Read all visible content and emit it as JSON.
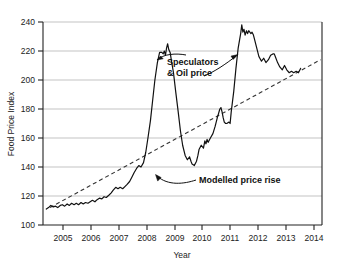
{
  "chart_data": {
    "type": "line",
    "title": "",
    "xlabel": "Year",
    "ylabel": "Food Price Index",
    "xlim": [
      2004.3,
      2014.35
    ],
    "ylim": [
      100,
      240
    ],
    "grid": true,
    "legend": "none",
    "yticks": [
      100,
      120,
      140,
      160,
      180,
      200,
      220,
      240
    ],
    "xticks": [
      2005,
      2006,
      2007,
      2008,
      2009,
      2010,
      2011,
      2012,
      2013,
      2014
    ],
    "series": [
      {
        "name": "Food Price Index",
        "style": "solid",
        "color": "#1a1a1a",
        "points": [
          [
            2004.42,
            111
          ],
          [
            2004.5,
            112
          ],
          [
            2004.58,
            113.5
          ],
          [
            2004.67,
            112.5
          ],
          [
            2004.75,
            113
          ],
          [
            2004.83,
            112
          ],
          [
            2004.92,
            113.5
          ],
          [
            2005.0,
            114
          ],
          [
            2005.08,
            113
          ],
          [
            2005.17,
            114.5
          ],
          [
            2005.25,
            113.5
          ],
          [
            2005.33,
            115
          ],
          [
            2005.42,
            114
          ],
          [
            2005.5,
            115
          ],
          [
            2005.58,
            114
          ],
          [
            2005.67,
            115.5
          ],
          [
            2005.75,
            114.5
          ],
          [
            2005.83,
            115.5
          ],
          [
            2005.92,
            115
          ],
          [
            2006.0,
            116
          ],
          [
            2006.08,
            117
          ],
          [
            2006.17,
            116
          ],
          [
            2006.25,
            117.5
          ],
          [
            2006.33,
            118.5
          ],
          [
            2006.42,
            118
          ],
          [
            2006.5,
            119.5
          ],
          [
            2006.58,
            119
          ],
          [
            2006.67,
            120.5
          ],
          [
            2006.75,
            122
          ],
          [
            2006.83,
            124
          ],
          [
            2006.92,
            126
          ],
          [
            2007.0,
            125
          ],
          [
            2007.08,
            126
          ],
          [
            2007.17,
            125
          ],
          [
            2007.25,
            126.5
          ],
          [
            2007.33,
            128
          ],
          [
            2007.42,
            130
          ],
          [
            2007.5,
            133
          ],
          [
            2007.58,
            136
          ],
          [
            2007.67,
            139
          ],
          [
            2007.75,
            141
          ],
          [
            2007.83,
            140
          ],
          [
            2007.92,
            143
          ],
          [
            2008.0,
            150
          ],
          [
            2008.08,
            160
          ],
          [
            2008.17,
            172
          ],
          [
            2008.25,
            186
          ],
          [
            2008.33,
            200
          ],
          [
            2008.42,
            212
          ],
          [
            2008.5,
            219
          ],
          [
            2008.58,
            219
          ],
          [
            2008.63,
            218
          ],
          [
            2008.67,
            220
          ],
          [
            2008.71,
            217
          ],
          [
            2008.75,
            222
          ],
          [
            2008.79,
            225
          ],
          [
            2008.83,
            221
          ],
          [
            2008.88,
            219
          ],
          [
            2008.92,
            214
          ],
          [
            2009.0,
            205
          ],
          [
            2009.08,
            192
          ],
          [
            2009.17,
            178
          ],
          [
            2009.25,
            165
          ],
          [
            2009.33,
            155
          ],
          [
            2009.42,
            148
          ],
          [
            2009.5,
            145
          ],
          [
            2009.58,
            147
          ],
          [
            2009.63,
            144
          ],
          [
            2009.67,
            142
          ],
          [
            2009.75,
            141
          ],
          [
            2009.83,
            144
          ],
          [
            2009.88,
            148
          ],
          [
            2009.92,
            152
          ],
          [
            2010.0,
            155
          ],
          [
            2010.08,
            153
          ],
          [
            2010.13,
            158
          ],
          [
            2010.17,
            156
          ],
          [
            2010.21,
            159
          ],
          [
            2010.25,
            157
          ],
          [
            2010.33,
            160
          ],
          [
            2010.42,
            163
          ],
          [
            2010.5,
            168
          ],
          [
            2010.58,
            174
          ],
          [
            2010.67,
            180
          ],
          [
            2010.71,
            181
          ],
          [
            2010.75,
            178
          ],
          [
            2010.79,
            174
          ],
          [
            2010.83,
            171
          ],
          [
            2010.88,
            170
          ],
          [
            2010.92,
            170
          ],
          [
            2011.0,
            171
          ],
          [
            2011.04,
            170
          ],
          [
            2011.08,
            178
          ],
          [
            2011.17,
            192
          ],
          [
            2011.25,
            208
          ],
          [
            2011.33,
            222
          ],
          [
            2011.42,
            232
          ],
          [
            2011.46,
            238
          ],
          [
            2011.5,
            233
          ],
          [
            2011.54,
            235
          ],
          [
            2011.58,
            231
          ],
          [
            2011.63,
            234
          ],
          [
            2011.67,
            232
          ],
          [
            2011.71,
            234
          ],
          [
            2011.75,
            233
          ],
          [
            2011.79,
            232
          ],
          [
            2011.83,
            233
          ],
          [
            2011.88,
            231
          ],
          [
            2011.92,
            228
          ],
          [
            2012.0,
            222
          ],
          [
            2012.08,
            216
          ],
          [
            2012.17,
            213
          ],
          [
            2012.25,
            215
          ],
          [
            2012.33,
            212
          ],
          [
            2012.42,
            214
          ],
          [
            2012.5,
            217
          ],
          [
            2012.58,
            218
          ],
          [
            2012.63,
            218
          ],
          [
            2012.67,
            216
          ],
          [
            2012.75,
            212
          ],
          [
            2012.83,
            209
          ],
          [
            2012.92,
            207
          ],
          [
            2013.0,
            210
          ],
          [
            2013.08,
            207
          ],
          [
            2013.17,
            205
          ],
          [
            2013.25,
            206
          ],
          [
            2013.33,
            205
          ],
          [
            2013.42,
            206
          ],
          [
            2013.5,
            205
          ],
          [
            2013.58,
            208
          ]
        ]
      },
      {
        "name": "Modelled price rise",
        "style": "dashed",
        "color": "#333333",
        "points": [
          [
            2004.55,
            112
          ],
          [
            2014.3,
            214
          ]
        ]
      }
    ],
    "annotations": [
      {
        "id": "speculators",
        "text_lines": [
          "Speculators",
          "& Oil price"
        ],
        "text_x": 2008.9,
        "text_y": 216,
        "arrows": [
          {
            "to_x": 2008.5,
            "to_y": 218,
            "label": "arrow-to-2008-peak"
          },
          {
            "to_x": 2011.35,
            "to_y": 222,
            "label": "arrow-to-2011-rise"
          }
        ]
      },
      {
        "id": "modelled",
        "text_lines": [
          "Modelled price rise"
        ],
        "text_x": 2010.55,
        "text_y": 130,
        "arrows": [
          {
            "to_x": 2009.15,
            "to_y": 135,
            "label": "arrow-to-trend-line"
          }
        ]
      }
    ]
  }
}
